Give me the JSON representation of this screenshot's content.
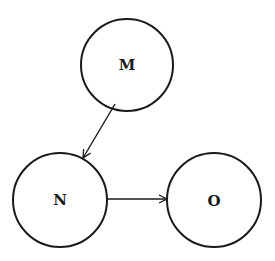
{
  "diagram": {
    "type": "directed-graph",
    "nodes": [
      {
        "id": "M",
        "label": "M",
        "cx": 127,
        "cy": 65,
        "r": 46
      },
      {
        "id": "N",
        "label": "N",
        "cx": 60,
        "cy": 200,
        "r": 47
      },
      {
        "id": "O",
        "label": "O",
        "cx": 214,
        "cy": 200,
        "r": 47
      }
    ],
    "edges": [
      {
        "from": "M",
        "to": "N"
      },
      {
        "from": "N",
        "to": "O"
      }
    ],
    "colors": {
      "stroke": "#1a1a1a",
      "background": "#ffffff"
    }
  }
}
